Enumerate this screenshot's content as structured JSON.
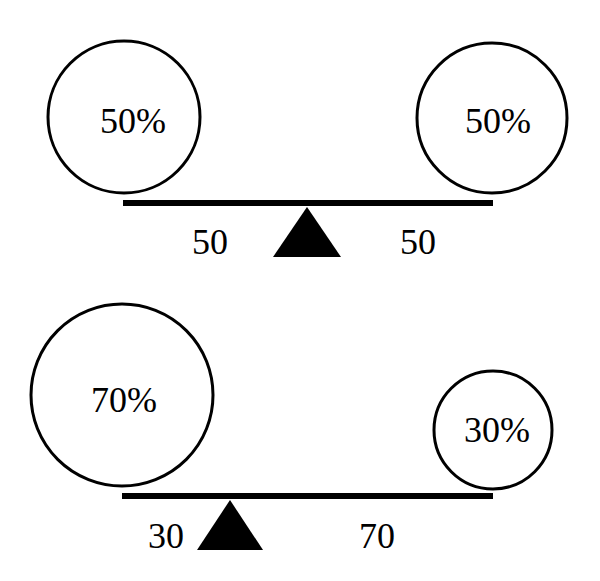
{
  "diagrams": [
    {
      "left_weight": {
        "label": "50%"
      },
      "right_weight": {
        "label": "50%"
      },
      "left_distance": "50",
      "right_distance": "50"
    },
    {
      "left_weight": {
        "label": "70%"
      },
      "right_weight": {
        "label": "30%"
      },
      "left_distance": "30",
      "right_distance": "70"
    }
  ],
  "colors": {
    "stroke": "#000000",
    "background": "#ffffff"
  }
}
